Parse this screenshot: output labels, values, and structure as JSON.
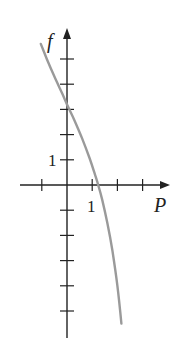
{
  "chart_data": {
    "type": "line",
    "title": "",
    "xlabel": "P",
    "ylabel": "f",
    "xlim": [
      -1.0,
      4.2
    ],
    "ylim": [
      -6.1,
      6.2
    ],
    "grid": false,
    "legend": null,
    "x_ticks": [
      -1,
      0,
      1,
      2,
      3
    ],
    "y_ticks": [
      -5,
      -4,
      -3,
      -2,
      -1,
      1,
      2,
      3,
      4,
      5
    ],
    "tick_labels": {
      "x": [
        {
          "value": 1,
          "label": "1"
        }
      ],
      "y": [
        {
          "value": 1,
          "label": "1"
        }
      ]
    },
    "series": [
      {
        "name": "f(P)",
        "color": "#9a9a9a",
        "x": [
          -1.04,
          -0.8,
          -0.5,
          -0.2,
          0.0,
          0.3,
          0.6,
          0.9,
          1.1,
          1.24,
          1.4,
          1.6,
          1.8,
          2.0,
          2.16
        ],
        "y": [
          5.6,
          5.0,
          4.3,
          3.65,
          3.2,
          2.55,
          1.85,
          1.05,
          0.45,
          0.0,
          -0.6,
          -1.5,
          -2.6,
          -4.0,
          -5.5
        ]
      }
    ]
  },
  "labels": {
    "x_axis": "P",
    "y_axis": "f",
    "x_tick_one": "1",
    "y_tick_one": "1"
  }
}
